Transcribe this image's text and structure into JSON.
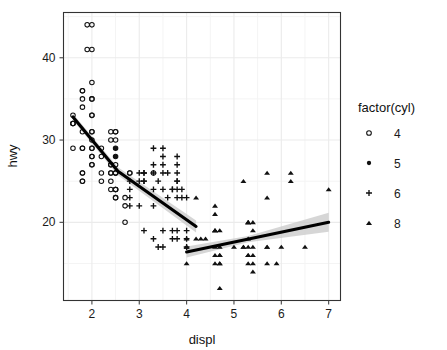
{
  "chart_data": {
    "type": "scatter",
    "title": "",
    "xlabel": "displ",
    "ylabel": "hwy",
    "xlim": [
      1.4,
      7.25
    ],
    "ylim": [
      10.5,
      45.5
    ],
    "xticks": [
      2,
      3,
      4,
      5,
      6,
      7
    ],
    "yticks": [
      20,
      30,
      40
    ],
    "grid": true,
    "legend": {
      "position": "right",
      "title": "factor(cyl)",
      "entries": [
        {
          "label": "4",
          "marker": "open-circle"
        },
        {
          "label": "5",
          "marker": "filled-circle"
        },
        {
          "label": "6",
          "marker": "plus"
        },
        {
          "label": "8",
          "marker": "filled-triangle"
        }
      ]
    },
    "series": [
      {
        "name": "4",
        "marker": "open-circle",
        "points": [
          [
            1.8,
            29
          ],
          [
            1.8,
            29
          ],
          [
            2.0,
            31
          ],
          [
            2.0,
            30
          ],
          [
            2.8,
            26
          ],
          [
            2.8,
            26
          ],
          [
            1.8,
            26
          ],
          [
            1.8,
            25
          ],
          [
            2.0,
            28
          ],
          [
            2.0,
            27
          ],
          [
            1.8,
            26
          ],
          [
            1.8,
            25
          ],
          [
            2.0,
            28
          ],
          [
            2.0,
            27
          ],
          [
            2.4,
            26
          ],
          [
            2.4,
            25
          ],
          [
            2.5,
            28
          ],
          [
            2.5,
            27
          ],
          [
            2.2,
            26
          ],
          [
            2.2,
            25
          ],
          [
            2.4,
            24
          ],
          [
            2.4,
            27
          ],
          [
            2.5,
            26
          ],
          [
            2.5,
            23
          ],
          [
            1.6,
            33
          ],
          [
            1.6,
            32
          ],
          [
            1.6,
            32
          ],
          [
            1.6,
            29
          ],
          [
            1.6,
            32
          ],
          [
            1.8,
            34
          ],
          [
            1.8,
            36
          ],
          [
            1.8,
            36
          ],
          [
            2.0,
            29
          ],
          [
            2.4,
            26
          ],
          [
            2.4,
            27
          ],
          [
            2.4,
            30
          ],
          [
            2.4,
            31
          ],
          [
            2.5,
            26
          ],
          [
            2.5,
            26
          ],
          [
            3.3,
            26
          ],
          [
            2.0,
            33
          ],
          [
            2.0,
            35
          ],
          [
            2.0,
            37
          ],
          [
            2.0,
            35
          ],
          [
            2.7,
            22
          ],
          [
            2.7,
            20
          ],
          [
            2.0,
            29
          ],
          [
            2.0,
            31
          ],
          [
            2.0,
            33
          ],
          [
            2.0,
            44
          ],
          [
            2.0,
            41
          ],
          [
            2.5,
            29
          ],
          [
            2.5,
            31
          ],
          [
            2.2,
            29
          ],
          [
            2.2,
            28
          ],
          [
            2.5,
            24
          ],
          [
            2.5,
            24
          ],
          [
            1.9,
            44
          ],
          [
            1.9,
            41
          ],
          [
            2.5,
            23
          ],
          [
            2.5,
            24
          ],
          [
            1.8,
            35
          ],
          [
            1.8,
            31
          ],
          [
            2.7,
            23
          ],
          [
            2.5,
            30
          ],
          [
            2.5,
            31
          ]
        ]
      },
      {
        "name": "5",
        "marker": "filled-circle",
        "points": [
          [
            2.5,
            29
          ],
          [
            2.5,
            29
          ],
          [
            2.5,
            28
          ],
          [
            2.5,
            28
          ]
        ]
      },
      {
        "name": "6",
        "marker": "plus",
        "points": [
          [
            2.8,
            24
          ],
          [
            2.8,
            25
          ],
          [
            3.1,
            25
          ],
          [
            3.1,
            26
          ],
          [
            2.8,
            23
          ],
          [
            3.1,
            26
          ],
          [
            3.1,
            25
          ],
          [
            3.8,
            24
          ],
          [
            3.8,
            25
          ],
          [
            4.0,
            23
          ],
          [
            3.7,
            24
          ],
          [
            3.7,
            24
          ],
          [
            3.9,
            23
          ],
          [
            3.9,
            24
          ],
          [
            3.3,
            29
          ],
          [
            3.3,
            27
          ],
          [
            3.3,
            26
          ],
          [
            3.5,
            29
          ],
          [
            3.5,
            28
          ],
          [
            3.5,
            27
          ],
          [
            3.5,
            26
          ],
          [
            3.6,
            26
          ],
          [
            3.0,
            26
          ],
          [
            3.0,
            25
          ],
          [
            3.3,
            24
          ],
          [
            3.4,
            25
          ],
          [
            3.5,
            24
          ],
          [
            3.8,
            26
          ],
          [
            3.8,
            25
          ],
          [
            3.8,
            28
          ],
          [
            3.8,
            27
          ],
          [
            4.0,
            19
          ],
          [
            4.0,
            18
          ],
          [
            3.8,
            18
          ],
          [
            3.8,
            19
          ],
          [
            3.5,
            17
          ],
          [
            3.4,
            17
          ],
          [
            3.7,
            18
          ],
          [
            3.7,
            19
          ],
          [
            3.0,
            22
          ],
          [
            3.3,
            22
          ],
          [
            2.8,
            22
          ],
          [
            4.0,
            17
          ],
          [
            3.8,
            23
          ],
          [
            3.6,
            23
          ],
          [
            3.5,
            19
          ],
          [
            3.3,
            18
          ],
          [
            3.1,
            19
          ]
        ]
      },
      {
        "name": "8",
        "marker": "filled-triangle",
        "points": [
          [
            5.3,
            20
          ],
          [
            5.3,
            20
          ],
          [
            5.3,
            20
          ],
          [
            5.7,
            17
          ],
          [
            6.0,
            17
          ],
          [
            5.7,
            17
          ],
          [
            6.2,
            26
          ],
          [
            6.2,
            25
          ],
          [
            7.0,
            24
          ],
          [
            5.3,
            16
          ],
          [
            5.3,
            15
          ],
          [
            5.3,
            16
          ],
          [
            5.7,
            23
          ],
          [
            5.4,
            20
          ],
          [
            5.4,
            19
          ],
          [
            4.0,
            18
          ],
          [
            4.2,
            23
          ],
          [
            4.6,
            19
          ],
          [
            4.6,
            19
          ],
          [
            4.6,
            22
          ],
          [
            4.6,
            21
          ],
          [
            4.7,
            17
          ],
          [
            4.7,
            16
          ],
          [
            4.7,
            15
          ],
          [
            5.2,
            17
          ],
          [
            5.2,
            17
          ],
          [
            5.7,
            15
          ],
          [
            5.9,
            15
          ],
          [
            4.7,
            12
          ],
          [
            4.7,
            16
          ],
          [
            4.7,
            15
          ],
          [
            4.6,
            15
          ],
          [
            5.4,
            14
          ],
          [
            5.4,
            17
          ],
          [
            4.0,
            17
          ],
          [
            4.0,
            17
          ],
          [
            4.6,
            16
          ],
          [
            5.0,
            17
          ],
          [
            4.2,
            18
          ],
          [
            4.4,
            18
          ],
          [
            4.6,
            17
          ],
          [
            5.4,
            16
          ],
          [
            5.4,
            15
          ],
          [
            6.5,
            17
          ],
          [
            5.7,
            26
          ],
          [
            5.2,
            25
          ],
          [
            4.7,
            19
          ],
          [
            4.6,
            19
          ],
          [
            5.3,
            17
          ],
          [
            5.3,
            18
          ],
          [
            4.0,
            15
          ],
          [
            4.3,
            18
          ]
        ]
      }
    ],
    "fits": [
      {
        "name": "lm-segment-left",
        "x0": 1.6,
        "y0": 32.8,
        "x1": 4.2,
        "y1": 19.5,
        "kink_x": 2.55,
        "kink_y": 26.2
      },
      {
        "name": "lm-segment-right",
        "x0": 4.0,
        "y0": 16.4,
        "x1": 7.0,
        "y1": 20.0
      }
    ],
    "colors": {
      "panel_background": "#ffffff",
      "grid_major": "#ebebeb",
      "grid_minor": "#f4f4f4",
      "panel_border": "#333333",
      "point": "#111111",
      "fit_line": "#000000",
      "fit_ribbon": "#c6c6c6",
      "text": "#1a1a1a"
    }
  }
}
